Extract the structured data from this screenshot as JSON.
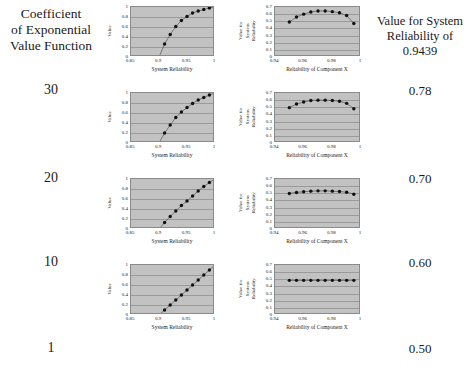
{
  "header": {
    "left_line1": "Coefficient",
    "left_line2": "of Exponential",
    "left_line3": "Value Function",
    "right_line1": "Value for System",
    "right_line2": "Reliability of",
    "right_line3": "0.9439"
  },
  "rows": [
    {
      "coefficient": "30",
      "value": "0.78"
    },
    {
      "coefficient": "20",
      "value": "0.70"
    },
    {
      "coefficient": "10",
      "value": "0.60"
    },
    {
      "coefficient": "1",
      "value": "0.50"
    }
  ],
  "axes": {
    "left_ylabel": "Value",
    "left_xlabel": "System Reliability",
    "left_xticks": [
      "0.85",
      "0.9",
      "0.95",
      "1"
    ],
    "left_yticks": [
      "1",
      "0.8",
      "0.6",
      "0.4",
      "0.2",
      "0"
    ],
    "right_ylabel": "Value for System Reliability",
    "right_xlabel": "Reliability of Component X",
    "right_xticks": [
      "0.94",
      "0.96",
      "0.98",
      "1"
    ],
    "right_yticks": [
      "0.7",
      "0.6",
      "0.5",
      "0.4",
      "0.3",
      "0.2",
      "0.1",
      "0"
    ]
  },
  "style": {
    "plot_bg": "#c2c2c2",
    "grid_color": "#9a9a9a",
    "marker_color": "#111111",
    "line_color": "#555555"
  },
  "chart_data": [
    {
      "type": "line",
      "id": "value-function-coef-30",
      "title": "",
      "xlabel": "System Reliability",
      "ylabel": "Value",
      "xlim": [
        0.85,
        1.0
      ],
      "ylim": [
        0,
        1
      ],
      "grid": true,
      "legend": "none",
      "x": [
        0.9,
        0.91,
        0.92,
        0.93,
        0.94,
        0.95,
        0.96,
        0.97,
        0.98,
        0.99,
        1.0
      ],
      "y": [
        0.0,
        0.26,
        0.45,
        0.61,
        0.73,
        0.81,
        0.88,
        0.92,
        0.95,
        0.98,
        1.0
      ]
    },
    {
      "type": "line",
      "id": "component-x-coef-30",
      "title": "",
      "xlabel": "Reliability of Component X",
      "ylabel": "Value for System Reliability",
      "xlim": [
        0.94,
        1.0
      ],
      "ylim": [
        0,
        0.7
      ],
      "grid": true,
      "legend": "none",
      "x": [
        0.95,
        0.955,
        0.96,
        0.965,
        0.97,
        0.975,
        0.98,
        0.985,
        0.99,
        0.995
      ],
      "y": [
        0.49,
        0.56,
        0.6,
        0.63,
        0.645,
        0.645,
        0.635,
        0.62,
        0.58,
        0.47
      ]
    },
    {
      "type": "line",
      "id": "value-function-coef-20",
      "title": "",
      "xlabel": "System Reliability",
      "ylabel": "Value",
      "xlim": [
        0.85,
        1.0
      ],
      "ylim": [
        0,
        1
      ],
      "grid": true,
      "legend": "none",
      "x": [
        0.9,
        0.91,
        0.92,
        0.93,
        0.94,
        0.95,
        0.96,
        0.97,
        0.98,
        0.99,
        1.0
      ],
      "y": [
        0.0,
        0.2,
        0.36,
        0.51,
        0.62,
        0.71,
        0.79,
        0.86,
        0.91,
        0.96,
        1.0
      ]
    },
    {
      "type": "line",
      "id": "component-x-coef-20",
      "title": "",
      "xlabel": "Reliability of Component X",
      "ylabel": "Value for System Reliability",
      "xlim": [
        0.94,
        1.0
      ],
      "ylim": [
        0,
        0.7
      ],
      "grid": true,
      "legend": "none",
      "x": [
        0.95,
        0.955,
        0.96,
        0.965,
        0.97,
        0.975,
        0.98,
        0.985,
        0.99,
        0.995
      ],
      "y": [
        0.495,
        0.545,
        0.575,
        0.595,
        0.6,
        0.6,
        0.595,
        0.585,
        0.555,
        0.48
      ]
    },
    {
      "type": "line",
      "id": "value-function-coef-10",
      "title": "",
      "xlabel": "System Reliability",
      "ylabel": "Value",
      "xlim": [
        0.85,
        1.0
      ],
      "ylim": [
        0,
        1
      ],
      "grid": true,
      "legend": "none",
      "x": [
        0.9,
        0.91,
        0.92,
        0.93,
        0.94,
        0.95,
        0.96,
        0.97,
        0.98,
        0.99,
        1.0
      ],
      "y": [
        0.0,
        0.13,
        0.25,
        0.36,
        0.47,
        0.56,
        0.66,
        0.76,
        0.85,
        0.93,
        1.0
      ]
    },
    {
      "type": "line",
      "id": "component-x-coef-10",
      "title": "",
      "xlabel": "Reliability of Component X",
      "ylabel": "Value for System Reliability",
      "xlim": [
        0.94,
        1.0
      ],
      "ylim": [
        0,
        0.7
      ],
      "grid": true,
      "legend": "none",
      "x": [
        0.95,
        0.955,
        0.96,
        0.965,
        0.97,
        0.975,
        0.98,
        0.985,
        0.99,
        0.995
      ],
      "y": [
        0.498,
        0.512,
        0.522,
        0.53,
        0.534,
        0.534,
        0.53,
        0.524,
        0.515,
        0.487
      ]
    },
    {
      "type": "line",
      "id": "value-function-coef-1",
      "title": "",
      "xlabel": "System Reliability",
      "ylabel": "Value",
      "xlim": [
        0.85,
        1.0
      ],
      "ylim": [
        0,
        1
      ],
      "grid": true,
      "legend": "none",
      "x": [
        0.9,
        0.91,
        0.92,
        0.93,
        0.94,
        0.95,
        0.96,
        0.97,
        0.98,
        0.99,
        1.0
      ],
      "y": [
        0.0,
        0.1,
        0.2,
        0.3,
        0.4,
        0.5,
        0.6,
        0.7,
        0.8,
        0.9,
        1.0
      ]
    },
    {
      "type": "line",
      "id": "component-x-coef-1",
      "title": "",
      "xlabel": "Reliability of Component X",
      "ylabel": "Value for System Reliability",
      "xlim": [
        0.94,
        1.0
      ],
      "ylim": [
        0,
        0.7
      ],
      "grid": true,
      "legend": "none",
      "x": [
        0.95,
        0.955,
        0.96,
        0.965,
        0.97,
        0.975,
        0.98,
        0.985,
        0.99,
        0.995
      ],
      "y": [
        0.485,
        0.485,
        0.485,
        0.485,
        0.485,
        0.485,
        0.485,
        0.485,
        0.485,
        0.485
      ]
    }
  ]
}
